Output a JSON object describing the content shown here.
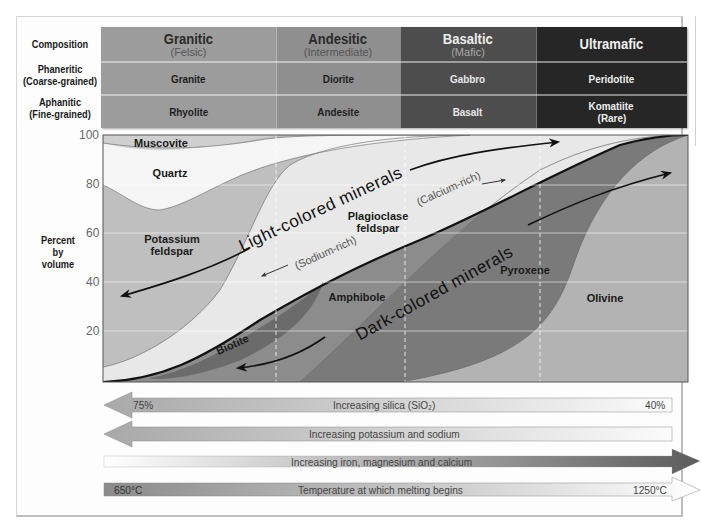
{
  "table": {
    "row_labels": {
      "composition": "Composition",
      "phaneritic": "Phaneritic",
      "phaneritic_sub": "(Coarse-grained)",
      "aphanitic": "Aphanitic",
      "aphanitic_sub": "(Fine-grained)"
    },
    "columns": [
      {
        "name": "Granitic",
        "sub": "(Felsic)",
        "phaneritic": "Granite",
        "aphanitic": "Rhyolite",
        "aphanitic_sub": "",
        "color": "#9c9c9c"
      },
      {
        "name": "Andesitic",
        "sub": "(Intermediate)",
        "phaneritic": "Diorite",
        "aphanitic": "Andesite",
        "aphanitic_sub": "",
        "color": "#8f8f8f"
      },
      {
        "name": "Basaltic",
        "sub": "(Mafic)",
        "phaneritic": "Gabbro",
        "aphanitic": "Basalt",
        "aphanitic_sub": "",
        "color": "#4d4d4d"
      },
      {
        "name": "Ultramafic",
        "sub": "",
        "phaneritic": "Peridotite",
        "aphanitic": "Komatiite",
        "aphanitic_sub": "(Rare)",
        "color": "#262626"
      }
    ]
  },
  "chart": {
    "ylabel_line1": "Percent",
    "ylabel_line2": "by",
    "ylabel_line3": "volume",
    "yticks": [
      "100",
      "80",
      "60",
      "40",
      "20"
    ],
    "minerals": {
      "muscovite": "Muscovite",
      "quartz": "Quartz",
      "potassium_feldspar_1": "Potassium",
      "potassium_feldspar_2": "feldspar",
      "plagioclase_1": "Plagioclase",
      "plagioclase_2": "feldspar",
      "sodium_rich": "(Sodium-rich)",
      "calcium_rich": "(Calcium-rich)",
      "biotite": "Biotite",
      "amphibole": "Amphibole",
      "pyroxene": "Pyroxene",
      "olivine": "Olivine"
    },
    "group_labels": {
      "light": "Light-colored minerals",
      "dark": "Dark-colored minerals"
    }
  },
  "bars": [
    {
      "label": "Increasing silica (SiO₂)",
      "left_value": "75%",
      "right_value": "40%",
      "direction": "left"
    },
    {
      "label": "Increasing potassium and sodium",
      "left_value": "",
      "right_value": "",
      "direction": "left"
    },
    {
      "label": "Increasing iron, magnesium and calcium",
      "left_value": "",
      "right_value": "",
      "direction": "right"
    },
    {
      "label": "Temperature at which melting begins",
      "left_value": "650°C",
      "right_value": "1250°C",
      "direction": "right"
    }
  ],
  "colors": {
    "granitic": "#9c9c9c",
    "andesitic": "#8f8f8f",
    "basaltic": "#4d4d4d",
    "ultramafic": "#262626",
    "quartz": "#f2f2f2",
    "k_feldspar": "#bdbdbd",
    "plagioclase": "#e6e6e6",
    "biotite": "#6e6e6e",
    "amphibole": "#8a8a8a",
    "pyroxene": "#767676",
    "olivine": "#b0b0b0"
  }
}
